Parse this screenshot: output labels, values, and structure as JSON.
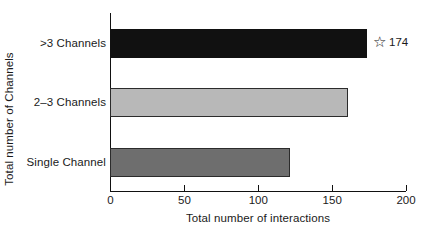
{
  "chart_data": {
    "type": "bar",
    "orientation": "horizontal",
    "title": "",
    "xlabel": "Total number of interactions",
    "ylabel": "Total number of Channels",
    "categories": [
      "Single Channel",
      "2–3 Channels",
      ">3 Channels"
    ],
    "values": [
      122,
      161,
      174
    ],
    "bar_colors": [
      "#6e6e6e",
      "#b8b8b8",
      "#111111"
    ],
    "xlim": [
      0,
      200
    ],
    "xticks": [
      0,
      50,
      100,
      150,
      200
    ],
    "xtick_labels": [
      "0",
      "50",
      "100",
      "150",
      "200"
    ],
    "grid": false,
    "legend": false,
    "annotations": [
      {
        "icon": "star-outline-icon",
        "glyph": "☆",
        "label": "174",
        "attached_to": ">3 Channels"
      }
    ]
  },
  "axes": {
    "y_title": "Total number of Channels",
    "x_title": "Total number of interactions"
  }
}
